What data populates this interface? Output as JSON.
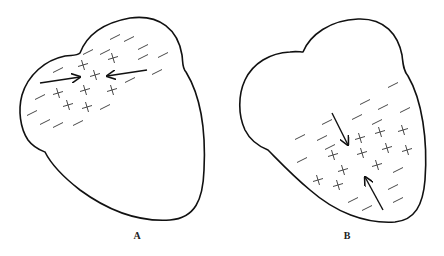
{
  "figure": {
    "panels": [
      {
        "label": "A",
        "label_pos": [
          137,
          235
        ],
        "outline": "M 80 53 C 88 32, 108 22, 130 18 C 160 14, 178 30, 182 55 C 183 62, 182 68, 186 72 C 200 95, 206 130, 204 170 C 203 200, 195 218, 170 220 C 140 222, 110 212, 80 190 C 62 176, 50 162, 45 152 C 40 150, 34 148, 28 140 C 20 128, 18 110, 22 95 C 28 75, 45 60, 65 56 C 72 55, 77 56, 80 53 Z",
        "minus": [
          [
            115,
            37
          ],
          [
            129,
            39
          ],
          [
            143,
            47
          ],
          [
            88,
            52
          ],
          [
            105,
            52
          ],
          [
            143,
            57
          ],
          [
            163,
            55
          ],
          [
            58,
            70
          ],
          [
            157,
            72
          ],
          [
            130,
            80
          ],
          [
            40,
            97
          ],
          [
            105,
            107
          ],
          [
            32,
            113
          ],
          [
            45,
            122
          ],
          [
            58,
            125
          ],
          [
            78,
            123
          ]
        ],
        "plus": [
          [
            113,
            58
          ],
          [
            83,
            65
          ],
          [
            95,
            75
          ],
          [
            85,
            90
          ],
          [
            112,
            90
          ],
          [
            58,
            93
          ],
          [
            68,
            105
          ],
          [
            87,
            107
          ]
        ],
        "arrows": [
          {
            "from": [
              40,
              83
            ],
            "to": [
              80,
              77
            ]
          },
          {
            "from": [
              147,
              70
            ],
            "to": [
              107,
              76
            ]
          }
        ]
      },
      {
        "label": "B",
        "label_pos": [
          347,
          235
        ],
        "outline": "M 303 52 C 310 35, 330 20, 358 19 C 385 18, 398 35, 402 55 C 403 63, 403 70, 408 76 C 422 100, 428 140, 425 180 C 423 205, 415 220, 395 222 C 365 224, 335 212, 310 190 C 292 175, 278 160, 268 150 C 258 146, 250 140, 245 130 C 238 115, 238 95, 245 80 C 253 63, 270 53, 290 52 C 296 51, 300 52, 303 52 Z",
        "minus": [
          [
            393,
            85
          ],
          [
            365,
            102
          ],
          [
            383,
            107
          ],
          [
            405,
            110
          ],
          [
            357,
            117
          ],
          [
            377,
            122
          ],
          [
            327,
            122
          ],
          [
            300,
            137
          ],
          [
            322,
            138
          ],
          [
            330,
            147
          ],
          [
            302,
            160
          ],
          [
            398,
            170
          ],
          [
            393,
            187
          ],
          [
            353,
            200
          ],
          [
            398,
            200
          ],
          [
            367,
            208
          ]
        ],
        "plus": [
          [
            360,
            138
          ],
          [
            380,
            132
          ],
          [
            403,
            130
          ],
          [
            362,
            153
          ],
          [
            387,
            148
          ],
          [
            407,
            150
          ],
          [
            333,
            155
          ],
          [
            377,
            165
          ],
          [
            343,
            170
          ],
          [
            318,
            180
          ],
          [
            338,
            185
          ]
        ],
        "arrows": [
          {
            "from": [
              332,
              113
            ],
            "to": [
              348,
              145
            ]
          },
          {
            "from": [
              383,
              210
            ],
            "to": [
              365,
              177
            ]
          }
        ]
      }
    ],
    "colors": {
      "stroke": "#111111",
      "symbol": "#333333",
      "background": "#ffffff"
    }
  }
}
